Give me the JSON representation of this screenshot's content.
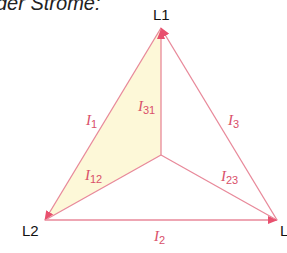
{
  "caption": "der Ströme:",
  "nodes": {
    "l1": "L1",
    "l2": "L2",
    "l3": "L"
  },
  "currents": {
    "i1": {
      "sym": "I",
      "sub": "1"
    },
    "i2": {
      "sym": "I",
      "sub": "2"
    },
    "i3": {
      "sym": "I",
      "sub": "3"
    },
    "i12": {
      "sym": "I",
      "sub": "12"
    },
    "i23": {
      "sym": "I",
      "sub": "23"
    },
    "i31": {
      "sym": "I",
      "sub": "31"
    }
  },
  "colors": {
    "line": "#e8899a",
    "arrow": "#e8506e",
    "fill": "#fdf8d8",
    "label": "#d9506a"
  }
}
